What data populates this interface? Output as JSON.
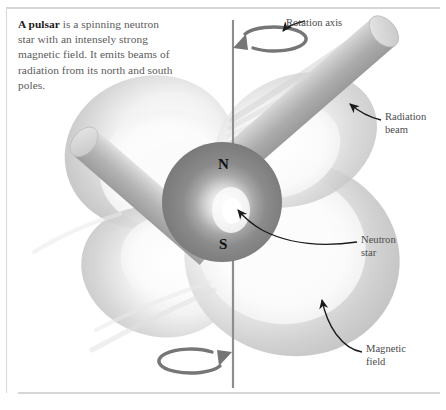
{
  "figure": {
    "caption": {
      "lead": "A pulsar",
      "body": " is a spinning neutron star with an intensely strong magnetic field. It emits beams of radiation from its north and south poles."
    },
    "labels": {
      "rotation_axis": "Rotation axis",
      "radiation_beam": "Radiation\nbeam",
      "neutron_star": "Neutron\nstar",
      "magnetic_field": "Magnetic\nfield"
    },
    "poles": {
      "north": "N",
      "south": "S"
    },
    "colors": {
      "background": "#ffffff",
      "caption_text": "#5b5b5b",
      "caption_lead_text": "#1d1d1d",
      "label_text": "#4c4c4c",
      "rule": "#c9c9c9",
      "axis_line": "#8d8d8d",
      "rotation_arrow": "#767676",
      "star_body_dark": "#808080",
      "star_core_highlight": "#f4f4f4",
      "beam_light": "#d6d6d6",
      "beam_mid": "#b6b6b6",
      "beam_dark": "#9a9a9a",
      "field_light": "#f1f1f1",
      "field_mid": "#cfcfcf",
      "field_dark": "#a8a8a8",
      "leader_line": "#1a1a1a"
    }
  }
}
